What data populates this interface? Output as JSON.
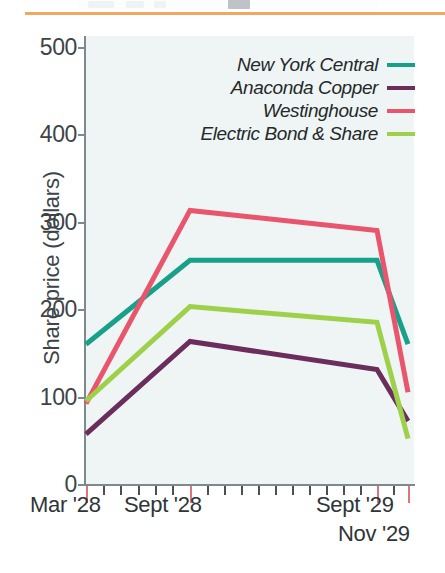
{
  "figure": {
    "top_rule_color": "#f0a860",
    "plot_background": "#eef5f4"
  },
  "axes": {
    "y_title": "Share price (dollars)",
    "y_ticks": [
      "0",
      "100",
      "200",
      "300",
      "400",
      "500"
    ],
    "y_min": 0,
    "y_max": 500,
    "x_labels": [
      {
        "text": "Mar '28",
        "left": 30,
        "top": 492
      },
      {
        "text": "Sept '28",
        "left": 124,
        "top": 492
      },
      {
        "text": "Sept '29",
        "left": 316,
        "top": 492
      },
      {
        "text": "Nov '29",
        "left": 338,
        "top": 521
      }
    ],
    "x_major_positions": [
      86,
      190,
      377,
      408
    ],
    "x_minor_count": 24
  },
  "legend": {
    "entries": [
      {
        "label": "New York Central",
        "color": "#18a08a"
      },
      {
        "label": "Anaconda Copper",
        "color": "#6b2d5c"
      },
      {
        "label": "Westinghouse",
        "color": "#e8556d"
      },
      {
        "label": "Electric Bond & Share",
        "color": "#9ed04a"
      }
    ]
  },
  "chart_data": {
    "type": "line",
    "title": "",
    "xlabel": "",
    "ylabel": "Share price (dollars)",
    "ylim": [
      0,
      500
    ],
    "grid": false,
    "legend_position": "top-right",
    "x": [
      "Mar '28",
      "Sept '28",
      "Sept '29",
      "Nov '29"
    ],
    "series": [
      {
        "name": "New York Central",
        "color": "#18a08a",
        "values": [
          160,
          256,
          256,
          160
        ]
      },
      {
        "name": "Anaconda Copper",
        "color": "#6b2d5c",
        "values": [
          57,
          163,
          131,
          72
        ]
      },
      {
        "name": "Westinghouse",
        "color": "#e8556d",
        "values": [
          92,
          313,
          290,
          105
        ]
      },
      {
        "name": "Electric Bond & Share",
        "color": "#9ed04a",
        "values": [
          95,
          203,
          185,
          52
        ]
      }
    ]
  }
}
